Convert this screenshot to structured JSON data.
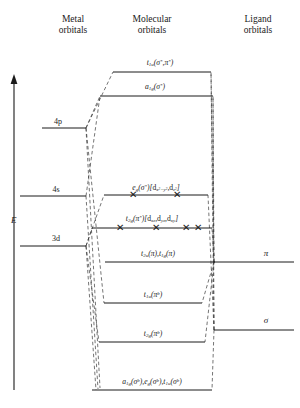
{
  "figure": {
    "columns": [
      {
        "id": "metal",
        "line1": "Metal",
        "line2": "orbitals",
        "x": 73,
        "y": 14
      },
      {
        "id": "molecular",
        "line1": "Molecular",
        "line2": "orbitals",
        "x": 152,
        "y": 14
      },
      {
        "id": "ligand",
        "line1": "Ligand",
        "line2": "orbitals",
        "x": 258,
        "y": 14
      }
    ],
    "energy_axis": {
      "label": "E",
      "x": 11,
      "y": 215,
      "arrow_top": 78,
      "arrow_bottom": 390
    }
  },
  "metal_levels": [
    {
      "id": "4p",
      "label": "4p",
      "x1": 42,
      "x2": 86,
      "y": 128,
      "label_x": 58,
      "label_y": 117
    },
    {
      "id": "4s",
      "label": "4s",
      "x1": 20,
      "x2": 86,
      "y": 196,
      "label_x": 56,
      "label_y": 185
    },
    {
      "id": "3d",
      "label": "3d",
      "x1": 20,
      "x2": 86,
      "y": 246,
      "label_x": 56,
      "label_y": 234
    }
  ],
  "ligand_levels": [
    {
      "id": "pi",
      "label": "π",
      "x1": 214,
      "x2": 294,
      "y": 262,
      "label_x": 266,
      "label_y": 253
    },
    {
      "id": "sigma",
      "label": "σ",
      "x1": 214,
      "x2": 294,
      "y": 330,
      "label_x": 266,
      "label_y": 320
    }
  ],
  "mo_levels": [
    {
      "id": "t1u-sigma-pi-star",
      "label_html": "<i>t</i><sub>1u</sub>(<i>σ</i><sup>*</sup>,<i>π</i><sup>*</sup>)",
      "x1": 113,
      "x2": 211,
      "y": 72,
      "label_x": 160,
      "label_y": 58,
      "electrons": []
    },
    {
      "id": "a1g-sigma-star",
      "label_html": "<i>a</i><sub>1g</sub>(<i>σ</i><sup>*</sup>)",
      "x1": 100,
      "x2": 213,
      "y": 96,
      "label_x": 155,
      "label_y": 82,
      "electrons": []
    },
    {
      "id": "eg-sigma-star",
      "label_html": "<i>e</i><sub>g</sub>(<i>σ</i><sup>*</sup>)[<span class=\"rom\">d</span><sub><i>x</i><sup>2</sup>−<i>y</i><sup>2</sup></sub>,<span class=\"rom\">d</span><sub><i>z</i><sup>2</sup></sub>]",
      "x1": 104,
      "x2": 208,
      "y": 195,
      "label_x": 156,
      "label_y": 183,
      "electrons": [
        {
          "x": 133,
          "glyph": "✕"
        },
        {
          "x": 177,
          "glyph": "✕"
        }
      ]
    },
    {
      "id": "t2g-pi-star",
      "label_html": "<i>t</i><sub>2g</sub>(<i>π</i><sup>*</sup>)[<span class=\"rom\">d</span><sub><i>xz</i></sub>,<span class=\"rom\">d</span><sub><i>yz</i></sub>,<span class=\"rom\">d</span><sub><i>xy</i></sub>]",
      "x1": 92,
      "x2": 212,
      "y": 228,
      "label_x": 152,
      "label_y": 214,
      "electrons": [
        {
          "x": 120,
          "glyph": "✕"
        },
        {
          "x": 156,
          "glyph": "✕"
        },
        {
          "x": 186,
          "glyph": "✕"
        },
        {
          "x": 198,
          "glyph": "✕"
        }
      ]
    },
    {
      "id": "t2u-t1g-pi",
      "label_html": "<i>t</i><sub>2u</sub>(<i>π</i>),<i>t</i><sub>1g</sub>(<i>π</i>)",
      "x1": 105,
      "x2": 215,
      "y": 262,
      "label_x": 158,
      "label_y": 249,
      "electrons": []
    },
    {
      "id": "t1u-pi-b",
      "label_html": "<i>t</i><sub>1u</sub>(<i>π</i><sup>b</sup>)",
      "x1": 104,
      "x2": 202,
      "y": 303,
      "label_x": 153,
      "label_y": 290,
      "electrons": []
    },
    {
      "id": "t2g-pi-b",
      "label_html": "<i>t</i><sub>2g</sub>(<i>π</i><sup>b</sup>)",
      "x1": 99,
      "x2": 205,
      "y": 342,
      "label_x": 153,
      "label_y": 329,
      "electrons": []
    },
    {
      "id": "a1g-eg-t1u-sigma-b",
      "label_html": "<i>a</i><sub>1g</sub>(<i>σ</i><sup>b</sup>),<i>e</i><sub>g</sub>(<i>σ</i><sup>b</sup>),<i>t</i><sub>1u</sub>(<i>σ</i><sup>b</sup>)",
      "x1": 92,
      "x2": 212,
      "y": 390,
      "label_x": 152,
      "label_y": 377,
      "electrons": []
    }
  ],
  "connectors": [
    {
      "from": "metal-4p",
      "x1": 86,
      "y1": 128,
      "x2": 113,
      "y2": 72
    },
    {
      "from": "metal-4p",
      "x1": 86,
      "y1": 128,
      "x2": 100,
      "y2": 96
    },
    {
      "from": "metal-4p",
      "x1": 86,
      "y1": 128,
      "x2": 100,
      "y2": 388
    },
    {
      "from": "metal-4p",
      "x1": 86,
      "y1": 128,
      "x2": 104,
      "y2": 303
    },
    {
      "from": "metal-4s",
      "x1": 86,
      "y1": 196,
      "x2": 100,
      "y2": 96
    },
    {
      "from": "metal-4s",
      "x1": 86,
      "y1": 196,
      "x2": 98,
      "y2": 389
    },
    {
      "from": "metal-3d",
      "x1": 86,
      "y1": 246,
      "x2": 104,
      "y2": 195
    },
    {
      "from": "metal-3d",
      "x1": 86,
      "y1": 246,
      "x2": 92,
      "y2": 228
    },
    {
      "from": "metal-3d",
      "x1": 86,
      "y1": 246,
      "x2": 99,
      "y2": 342
    },
    {
      "from": "metal-3d",
      "x1": 86,
      "y1": 246,
      "x2": 96,
      "y2": 390
    },
    {
      "from": "ligand-pi",
      "x1": 214,
      "y1": 262,
      "x2": 211,
      "y2": 72
    },
    {
      "from": "ligand-pi",
      "x1": 214,
      "y1": 262,
      "x2": 213,
      "y2": 96
    },
    {
      "from": "ligand-pi",
      "x1": 214,
      "y1": 262,
      "x2": 212,
      "y2": 228
    },
    {
      "from": "ligand-pi",
      "x1": 214,
      "y1": 262,
      "x2": 202,
      "y2": 303
    },
    {
      "from": "ligand-pi",
      "x1": 214,
      "y1": 262,
      "x2": 205,
      "y2": 342
    },
    {
      "from": "ligand-sigma",
      "x1": 214,
      "y1": 330,
      "x2": 213,
      "y2": 96
    },
    {
      "from": "ligand-sigma",
      "x1": 214,
      "y1": 330,
      "x2": 211,
      "y2": 72
    },
    {
      "from": "ligand-sigma",
      "x1": 214,
      "y1": 330,
      "x2": 208,
      "y2": 195
    },
    {
      "from": "ligand-sigma",
      "x1": 214,
      "y1": 330,
      "x2": 212,
      "y2": 390
    }
  ]
}
